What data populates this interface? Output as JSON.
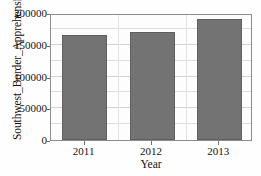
{
  "chart_data": {
    "type": "bar",
    "title": "",
    "xlabel": "Year",
    "ylabel": "Southwest_Border_Apprehensions",
    "categories": [
      "2011",
      "2012",
      "2013"
    ],
    "values": [
      165000,
      170000,
      191000
    ],
    "ylim": [
      0,
      200000
    ],
    "y_ticks": [
      0,
      50000,
      100000,
      150000,
      200000
    ],
    "y_tick_labels": [
      "0",
      "50000",
      "100000",
      "150000",
      "200000"
    ],
    "y_minor_step": 25000,
    "grid": true,
    "legend": null,
    "bar_color": "#737373",
    "bar_edge_color": "#5f5f5f",
    "grid_color": "#dddddd",
    "axes_color": "#8c8c8c",
    "background_color": "#fdfdfd"
  }
}
